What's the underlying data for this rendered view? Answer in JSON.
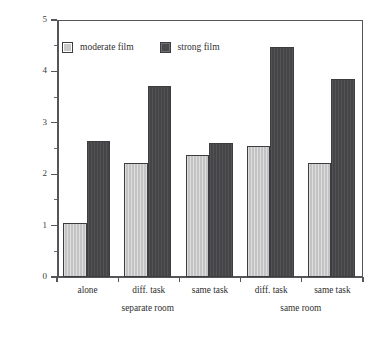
{
  "chart_data": {
    "type": "bar",
    "title": "",
    "xlabel": "",
    "ylabel": "Number of AU12",
    "ylim": [
      0,
      5
    ],
    "ytick_labels": [
      "0",
      "1",
      "2",
      "3",
      "4",
      "5"
    ],
    "ytick_values": [
      0,
      1,
      2,
      3,
      4,
      5
    ],
    "yminor_values": [
      0.5,
      1.5,
      2.5,
      3.5,
      4.5
    ],
    "grid": false,
    "legend_position": "top-left-inside",
    "categories": [
      "alone",
      "diff. task",
      "same task",
      "diff. task",
      "same task"
    ],
    "group_labels": [
      "separate room",
      "same room"
    ],
    "group_spans": [
      [
        0,
        2
      ],
      [
        3,
        4
      ]
    ],
    "series": [
      {
        "name": "moderate film",
        "color": "#c9c9c9",
        "values": [
          1.05,
          2.22,
          2.38,
          2.55,
          2.22
        ]
      },
      {
        "name": "strong film",
        "color": "#4a4a4c",
        "values": [
          2.65,
          3.72,
          2.6,
          4.48,
          3.85
        ]
      }
    ]
  },
  "axis": {
    "y_title": "Number of AU12"
  },
  "legend": {
    "entries": [
      {
        "label": "moderate film",
        "swatch": "moderate-swatch-icon"
      },
      {
        "label": "strong film",
        "swatch": "strong-swatch-icon"
      }
    ]
  }
}
